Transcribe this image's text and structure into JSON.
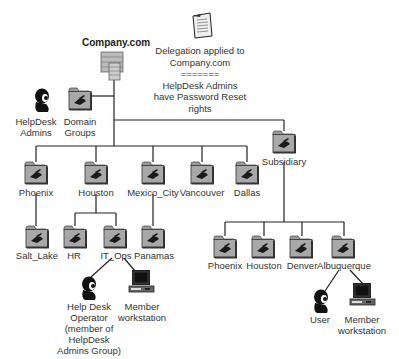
{
  "diagram": {
    "root": {
      "label": "Company.com"
    },
    "note": {
      "line1": "Delegation applied to",
      "line2": "Company.com",
      "line3": "=======",
      "line4": "HelpDesk Admins",
      "line5": "have Password Reset",
      "line6": "rights"
    },
    "helpdesk_admins": {
      "line1": "HelpDesk",
      "line2": "Admins"
    },
    "domain_groups": {
      "line1": "Domain",
      "line2": "Groups"
    },
    "ous_level1": [
      {
        "label": "Phoenix"
      },
      {
        "label": "Houston"
      },
      {
        "label": "Mexico_City"
      },
      {
        "label": "Vancouver"
      },
      {
        "label": "Dallas"
      }
    ],
    "subsidiary": {
      "label": "Subsidiary"
    },
    "ous_level2": {
      "salt_lake": "Salt_Lake",
      "hr": "HR",
      "it_ops": "IT_Ops",
      "panamas": "Panamas"
    },
    "subsidiary_children": [
      {
        "label": "Phoenix"
      },
      {
        "label": "Houston"
      },
      {
        "label": "Denver"
      },
      {
        "label": "Albuquerque"
      }
    ],
    "it_ops_members": {
      "operator": {
        "line1": "Help Desk",
        "line2": "Operator",
        "line3": "(member of",
        "line4": "HelpDesk",
        "line5": "Admins Group)"
      },
      "workstation": {
        "line1": "Member",
        "line2": "workstation"
      }
    },
    "albuquerque_members": {
      "user": {
        "label": "User"
      },
      "workstation": {
        "line1": "Member",
        "line2": "workstation"
      }
    }
  }
}
